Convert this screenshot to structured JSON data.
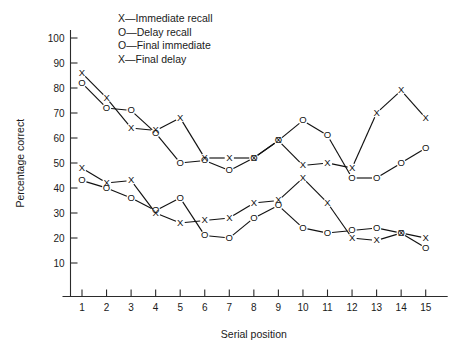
{
  "chart_data": {
    "type": "line",
    "title": "",
    "xlabel": "Serial position",
    "ylabel": "Percentage correct",
    "categories": [
      1,
      2,
      3,
      4,
      5,
      6,
      7,
      8,
      9,
      10,
      11,
      12,
      13,
      14,
      15
    ],
    "x": [
      1,
      2,
      3,
      4,
      5,
      6,
      7,
      8,
      9,
      10,
      11,
      12,
      13,
      14,
      15
    ],
    "xlim": [
      1,
      15
    ],
    "ylim": [
      0,
      100
    ],
    "yticks": [
      10,
      20,
      30,
      40,
      50,
      60,
      70,
      80,
      90,
      100
    ],
    "xticks": [
      1,
      2,
      3,
      4,
      5,
      6,
      7,
      8,
      9,
      10,
      11,
      12,
      13,
      14,
      15
    ],
    "grid": false,
    "legend_position": "top-left",
    "series": [
      {
        "name": "Immediate recall",
        "marker": "X",
        "values": [
          86,
          76,
          64,
          63,
          68,
          52,
          52,
          52,
          59,
          49,
          50,
          48,
          70,
          79,
          68
        ]
      },
      {
        "name": "Delay recall",
        "marker": "O",
        "values": [
          82,
          72,
          71,
          62,
          50,
          51,
          47,
          52,
          59,
          67,
          61,
          44,
          44,
          50,
          56
        ]
      },
      {
        "name": "Final immediate",
        "marker": "O",
        "values": [
          43,
          40,
          36,
          31,
          36,
          21,
          20,
          28,
          33,
          24,
          22,
          23,
          24,
          22,
          16
        ]
      },
      {
        "name": "Final delay",
        "marker": "X",
        "values": [
          48,
          42,
          43,
          30,
          26,
          27,
          28,
          34,
          35,
          44,
          34,
          20,
          19,
          22,
          20
        ]
      }
    ],
    "legend_entries": [
      {
        "marker": "X",
        "dash": "—",
        "label": "Immediate recall"
      },
      {
        "marker": "O",
        "dash": "—",
        "label": "Delay recall"
      },
      {
        "marker": "O",
        "dash": "—",
        "label": "Final immediate"
      },
      {
        "marker": "X",
        "dash": "—",
        "label": "Final delay"
      }
    ],
    "colors": {
      "line": "#111111",
      "axis": "#2b2b2b",
      "background": "#ffffff"
    }
  }
}
